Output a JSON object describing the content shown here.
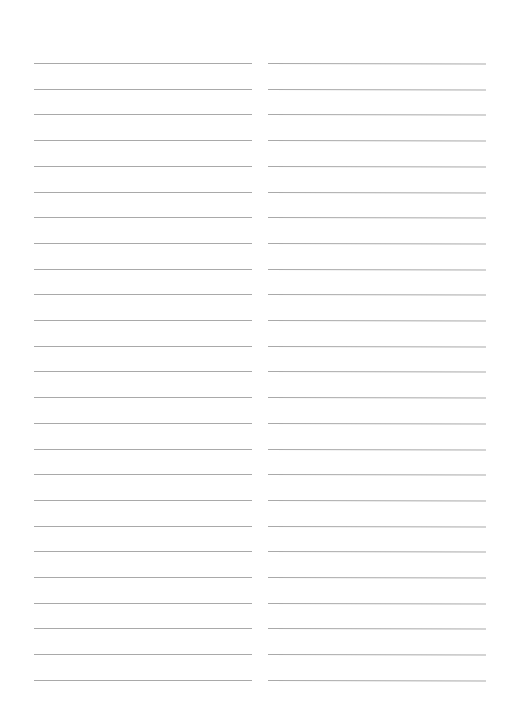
{
  "page": {
    "type": "lined-paper",
    "background": "#ffffff",
    "rule_color": "#a9a9a9",
    "columns": 2,
    "lines_per_column": 25,
    "first_line_y": 63,
    "line_spacing": 25.7
  }
}
